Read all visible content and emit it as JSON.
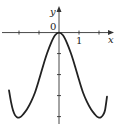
{
  "chart_data": {
    "type": "line",
    "title": "",
    "xlabel": "x",
    "ylabel": "y",
    "origin_label": "0",
    "x_tick_labels": [
      {
        "value": 1,
        "label": "1"
      }
    ],
    "x_ticks": [
      -2,
      -1,
      1,
      2
    ],
    "y_ticks": [
      -1,
      -2,
      -3,
      -4
    ],
    "xlim": [
      -2.95,
      2.85
    ],
    "ylim": [
      -4.4,
      1.55
    ],
    "grid": false,
    "legend": "none",
    "series": [
      {
        "name": "curve",
        "color": "#222222",
        "x": [
          -2.5,
          -2.4,
          -2.3,
          -2.2,
          -2.1,
          -2.0,
          -1.9,
          -1.8,
          -1.6,
          -1.4,
          -1.2,
          -1.0,
          -0.8,
          -0.6,
          -0.4,
          -0.2,
          0.0,
          0.2,
          0.4,
          0.6,
          0.8,
          1.0,
          1.2,
          1.4,
          1.6,
          1.8,
          1.9,
          2.0,
          2.1,
          2.2,
          2.3,
          2.4
        ],
        "y": [
          -2.75,
          -3.3,
          -3.7,
          -3.93,
          -4.03,
          -4.05,
          -4.0,
          -3.9,
          -3.65,
          -3.3,
          -2.85,
          -2.25,
          -1.6,
          -1.0,
          -0.5,
          -0.13,
          0.0,
          -0.13,
          -0.5,
          -1.0,
          -1.6,
          -2.25,
          -2.85,
          -3.3,
          -3.65,
          -3.9,
          -4.0,
          -4.05,
          -4.03,
          -3.93,
          -3.7,
          -3.05
        ]
      }
    ]
  }
}
